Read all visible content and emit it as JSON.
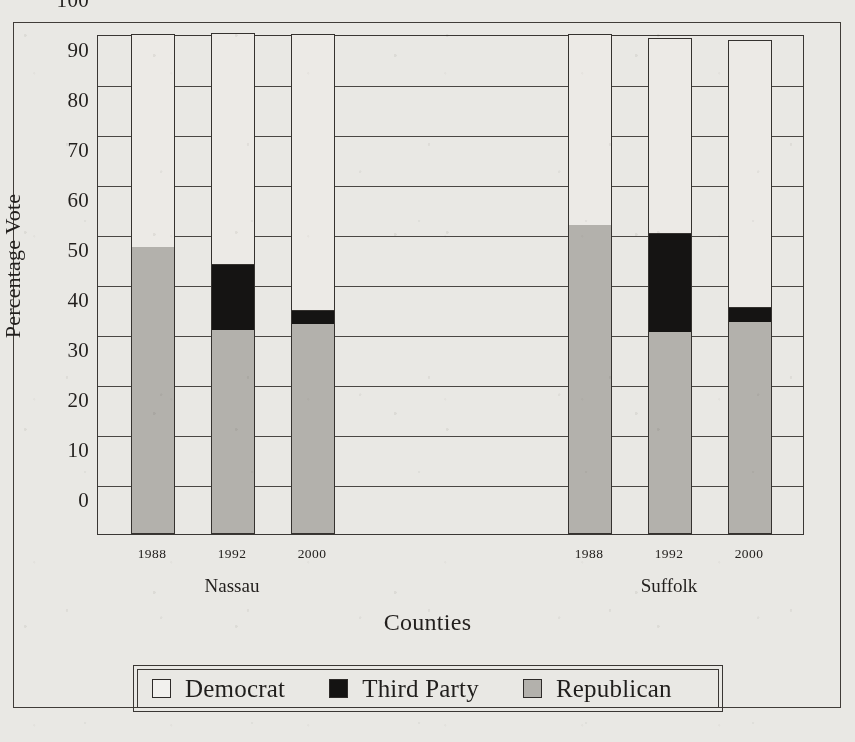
{
  "chart_data": {
    "type": "bar",
    "subtype": "stacked-bar",
    "title": "",
    "xlabel": "Counties",
    "ylabel": "Percentage Vote",
    "ylim": [
      0,
      100
    ],
    "yticks": [
      0,
      10,
      20,
      30,
      40,
      50,
      60,
      70,
      80,
      90,
      100
    ],
    "ytick_labels": [
      "0",
      "10",
      "20",
      "30",
      "40",
      "50",
      "60",
      "70",
      "80",
      "90",
      "100"
    ],
    "grid": true,
    "grid_axis": "y",
    "legend_position": "bottom",
    "stack_order_bottom_to_top": [
      "Republican",
      "Third Party",
      "Democrat"
    ],
    "groups": [
      "Nassau",
      "Suffolk"
    ],
    "categories": [
      "1988",
      "1992",
      "2000",
      "1988",
      "1992",
      "2000"
    ],
    "series": [
      {
        "name": "Republican",
        "color": "#b3b1ac",
        "values": [
          57.4,
          40.8,
          42.0,
          61.8,
          40.4,
          42.4
        ]
      },
      {
        "name": "Third Party",
        "color": "#151413",
        "values": [
          0.0,
          13.2,
          2.8,
          0.0,
          19.8,
          3.0
        ]
      },
      {
        "name": "Democrat",
        "color": "#f2f1ee",
        "values": [
          42.6,
          46.3,
          55.2,
          38.2,
          39.0,
          53.4
        ]
      }
    ],
    "bars": [
      {
        "group": "Nassau",
        "year": "1988",
        "republican": 57.4,
        "third_party": 0.0,
        "democrat": 42.6,
        "total": 100.0
      },
      {
        "group": "Nassau",
        "year": "1992",
        "republican": 40.8,
        "third_party": 13.2,
        "democrat": 46.3,
        "total": 100.3
      },
      {
        "group": "Nassau",
        "year": "2000",
        "republican": 42.0,
        "third_party": 2.8,
        "democrat": 55.2,
        "total": 100.0
      },
      {
        "group": "Suffolk",
        "year": "1988",
        "republican": 61.8,
        "third_party": 0.0,
        "democrat": 38.2,
        "total": 100.0
      },
      {
        "group": "Suffolk",
        "year": "1992",
        "republican": 40.4,
        "third_party": 19.8,
        "democrat": 39.0,
        "total": 99.2
      },
      {
        "group": "Suffolk",
        "year": "2000",
        "republican": 42.4,
        "third_party": 3.0,
        "democrat": 53.4,
        "total": 98.8
      }
    ]
  },
  "axes": {
    "y_title": "Percentage Vote",
    "x_title": "Counties",
    "y_tick_labels": [
      "100",
      "90",
      "80",
      "70",
      "60",
      "50",
      "40",
      "30",
      "20",
      "10",
      "0"
    ],
    "x_tick_labels": [
      "1988",
      "1992",
      "2000",
      "1988",
      "1992",
      "2000"
    ],
    "group_labels": [
      "Nassau",
      "Suffolk"
    ]
  },
  "legend": {
    "items": [
      {
        "label": "Democrat",
        "swatch": "democrat-swatch",
        "color": "#f2f1ee"
      },
      {
        "label": "Third Party",
        "swatch": "third-party-swatch",
        "color": "#151413"
      },
      {
        "label": "Republican",
        "swatch": "republican-swatch",
        "color": "#b3b1ac"
      }
    ]
  },
  "colors": {
    "paper": "#e9e8e4",
    "ink": "#201e1c",
    "rule": "#3a3734",
    "republican": "#b3b1ac",
    "third_party": "#151413",
    "democrat": "#f2f1ee"
  }
}
